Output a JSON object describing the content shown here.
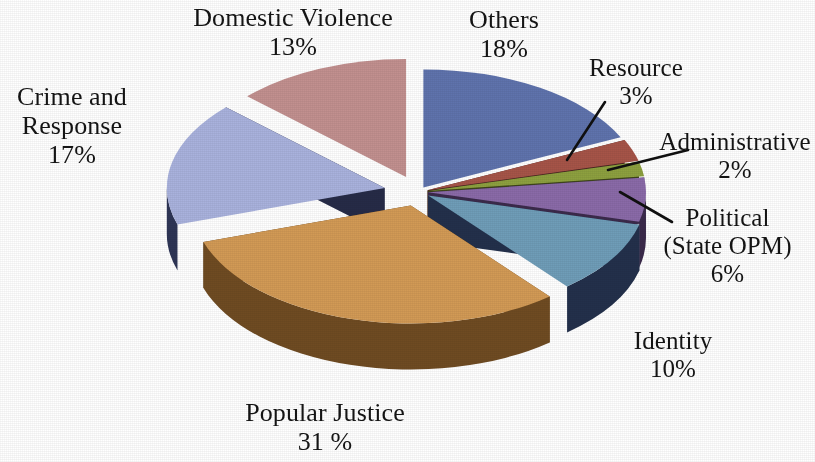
{
  "chart_data": {
    "type": "pie",
    "title": "",
    "subtitle": "",
    "xlabel": "",
    "ylabel": "",
    "legend_position": "none",
    "style": "3d-exploded-pie",
    "total_percent": 100,
    "categories": [
      "Others",
      "Resource",
      "Administrative",
      "Political (State OPM)",
      "Identity",
      "Popular Justice",
      "Crime and Response",
      "Domestic Violence"
    ],
    "values": [
      18,
      3,
      2,
      6,
      10,
      31,
      17,
      13
    ],
    "colors": [
      "#5f73ad",
      "#a65448",
      "#8da03f",
      "#8a6aa8",
      "#6f9db8",
      "#d29a55",
      "#a9b2dd",
      "#c2908f"
    ],
    "slices": [
      {
        "name": "Others",
        "value": 18,
        "label": "Others",
        "percent_text": "18%",
        "color": "#5f73ad",
        "side_color": "#2f3558",
        "leader_line": false
      },
      {
        "name": "Resource",
        "value": 3,
        "label": "Resource",
        "percent_text": "3%",
        "color": "#a65448",
        "side_color": "#4a2422",
        "leader_line": true
      },
      {
        "name": "Administrative",
        "value": 2,
        "label": "Administrative",
        "percent_text": "2%",
        "color": "#8da03f",
        "side_color": "#3e441a",
        "leader_line": true
      },
      {
        "name": "Political (State OPM)",
        "value": 6,
        "label": "Political",
        "label_line2": "(State OPM)",
        "percent_text": "6%",
        "color": "#8a6aa8",
        "side_color": "#3b2a4b",
        "leader_line": true
      },
      {
        "name": "Identity",
        "value": 10,
        "label": "Identity",
        "percent_text": "10%",
        "color": "#6f9db8",
        "side_color": "#23304b",
        "leader_line": false
      },
      {
        "name": "Popular Justice",
        "value": 31,
        "label": "Popular Justice",
        "percent_text": "31 %",
        "color": "#d29a55",
        "side_color": "#6f4b22",
        "leader_line": false
      },
      {
        "name": "Crime and Response",
        "value": 17,
        "label": "Crime and",
        "label_line2": "Response",
        "percent_text": "17%",
        "color": "#a9b2dd",
        "side_color": "#2e3556",
        "leader_line": false
      },
      {
        "name": "Domestic Violence",
        "value": 13,
        "label": "Domestic Violence",
        "percent_text": "13%",
        "color": "#c2908f",
        "side_color": "#3b2326",
        "leader_line": false
      }
    ]
  },
  "labels": {
    "domestic_violence": {
      "name": "Domestic Violence",
      "percent": "13%"
    },
    "crime_response": {
      "name_line1": "Crime and",
      "name_line2": "Response",
      "percent": "17%"
    },
    "others": {
      "name": "Others",
      "percent": "18%"
    },
    "resource": {
      "name": "Resource",
      "percent": "3%"
    },
    "administrative": {
      "name": "Administrative",
      "percent": "2%"
    },
    "political": {
      "name_line1": "Political",
      "name_line2": "(State OPM)",
      "percent": "6%"
    },
    "identity": {
      "name": "Identity",
      "percent": "10%"
    },
    "popular_justice": {
      "name": "Popular Justice",
      "percent": "31 %"
    }
  },
  "background_color": "#ffffff",
  "text_color": "#141414"
}
